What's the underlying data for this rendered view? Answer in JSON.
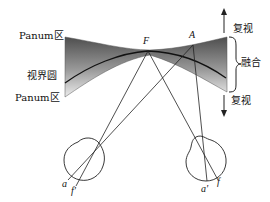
{
  "figure": {
    "type": "binocular horopter / Panum's fusional area diagram",
    "labels": {
      "panum_upper": "Panum区",
      "horopter": "视界圆",
      "panum_lower": "Panum区",
      "fixation_point": "F",
      "object_point": "A",
      "diplopia_upper": "复视",
      "fusion": "融合",
      "diplopia_lower": "复视",
      "left_eye_a": "a",
      "left_eye_f": "f'",
      "right_eye_a": "a'",
      "right_eye_f": "f"
    },
    "colors": {
      "band_dark": "#5a5a5a",
      "band_light": "#e6e6e6",
      "line": "#222222"
    }
  }
}
